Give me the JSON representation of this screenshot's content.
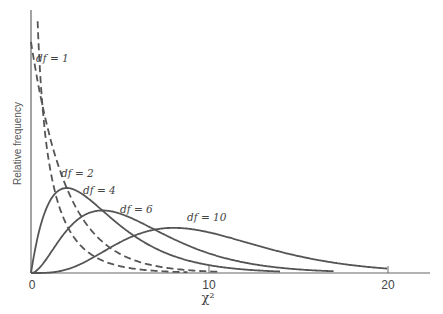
{
  "chart_data": {
    "type": "line",
    "title": "",
    "xlabel": "χ²",
    "ylabel": "Relative frequency",
    "xlim": [
      0,
      22
    ],
    "ylim": [
      0,
      0.55
    ],
    "x_ticks": [
      "0",
      "10",
      "20"
    ],
    "grid": false,
    "legend": "inline labels",
    "series": [
      {
        "name": "df = 1",
        "style": "dashed",
        "peak_x": 0,
        "description": "chi-square density, df=1, decreasing from top of axis"
      },
      {
        "name": "df = 2",
        "style": "dashed",
        "peak_x": 0,
        "peak_y": 0.5,
        "description": "chi-square density, df=2, exponential decay"
      },
      {
        "name": "df = 4",
        "style": "solid",
        "peak_x": 2,
        "peak_y": 0.18
      },
      {
        "name": "df = 6",
        "style": "solid",
        "peak_x": 4,
        "peak_y": 0.135
      },
      {
        "name": "df = 10",
        "style": "solid",
        "peak_x": 8,
        "peak_y": 0.098
      }
    ],
    "annotations": [
      "df = 1",
      "df = 2",
      "df = 4",
      "df = 6",
      "df = 10"
    ]
  },
  "labels": {
    "ylabel": "Relative frequency",
    "xlabel": "χ²",
    "tick0": "0",
    "tick10": "10",
    "tick20": "20",
    "df1": "df = 1",
    "df2": "df = 2",
    "df4": "df = 4",
    "df6": "df = 6",
    "df10": "df = 10"
  },
  "style": {
    "line_color": "#555555",
    "axis_color": "#666666"
  }
}
